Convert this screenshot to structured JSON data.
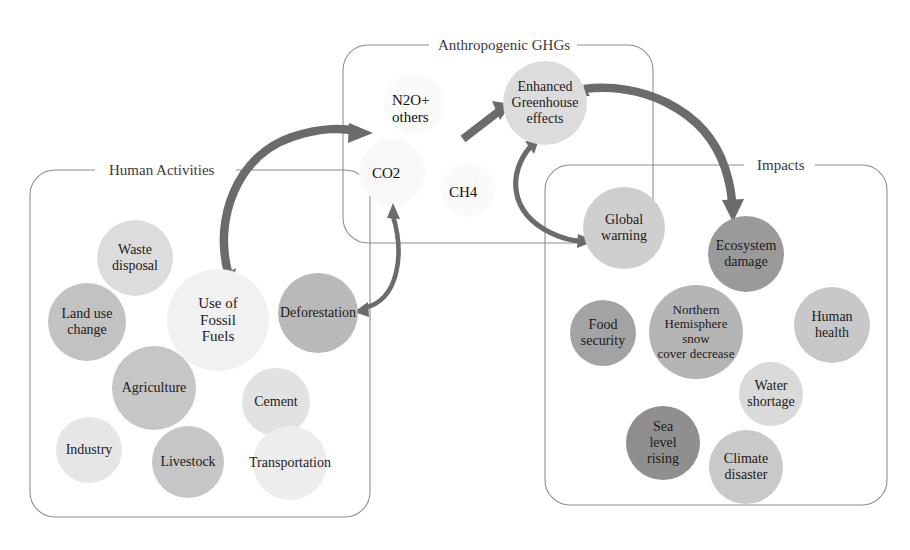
{
  "diagram": {
    "title_hidden": "",
    "groups": [
      {
        "id": "human-activities",
        "label": "Human Activities"
      },
      {
        "id": "anthropogenic-ghgs",
        "label": "Anthropogenic GHGs"
      },
      {
        "id": "impacts",
        "label": "Impacts"
      }
    ]
  },
  "human_activities": {
    "label": "Human Activities",
    "bubbles": [
      {
        "id": "waste-disposal",
        "label": "Waste\ndisposal",
        "color": "#dcdcdc",
        "cx": 135,
        "cy": 258,
        "r": 38,
        "fs": 14
      },
      {
        "id": "land-use-change",
        "label": "Land use\nchange",
        "color": "#c2c2c2",
        "cx": 87,
        "cy": 322,
        "r": 39,
        "fs": 14
      },
      {
        "id": "use-fossil-fuels",
        "label": "Use of\nFossil\nFuels",
        "color": "#f1f1f1",
        "cx": 218,
        "cy": 320,
        "r": 51,
        "fs": 15
      },
      {
        "id": "deforestation",
        "label": "Deforestation",
        "color": "#b9b9b9",
        "cx": 318,
        "cy": 313,
        "r": 40,
        "fs": 14
      },
      {
        "id": "agriculture",
        "label": "Agriculture",
        "color": "#c6c6c6",
        "cx": 154,
        "cy": 388,
        "r": 42,
        "fs": 14
      },
      {
        "id": "cement",
        "label": "Cement",
        "color": "#e2e2e2",
        "cx": 276,
        "cy": 402,
        "r": 34,
        "fs": 14
      },
      {
        "id": "industry",
        "label": "Industry",
        "color": "#e6e6e6",
        "cx": 89,
        "cy": 450,
        "r": 33,
        "fs": 14
      },
      {
        "id": "livestock",
        "label": "Livestock",
        "color": "#c6c6c6",
        "cx": 188,
        "cy": 462,
        "r": 36,
        "fs": 14
      },
      {
        "id": "transportation",
        "label": "Transportation",
        "color": "#ededed",
        "cx": 290,
        "cy": 463,
        "r": 37,
        "fs": 14
      }
    ]
  },
  "anthropogenic_ghgs": {
    "label": "Anthropogenic GHGs",
    "gas_labels": [
      {
        "id": "n2o-others",
        "label": "N2O+\nothers",
        "x": 392,
        "y": 92,
        "fs": 15,
        "halo": {
          "cx": 414,
          "cy": 104,
          "r": 30,
          "color": "#fafafa"
        }
      },
      {
        "id": "co2",
        "label": "CO2",
        "x": 372,
        "y": 165,
        "fs": 15,
        "halo": {
          "cx": 392,
          "cy": 172,
          "r": 33,
          "color": "#f8f8f8"
        }
      },
      {
        "id": "ch4",
        "label": "CH4",
        "x": 449,
        "y": 184,
        "fs": 15,
        "halo": {
          "cx": 468,
          "cy": 190,
          "r": 27,
          "color": "#fafafa"
        }
      }
    ],
    "bubbles": [
      {
        "id": "enhanced-greenhouse-effects",
        "label": "Enhanced\nGreenhouse\neffects",
        "color": "#dcdcdc",
        "cx": 545,
        "cy": 103,
        "r": 42,
        "fs": 14
      }
    ]
  },
  "impacts": {
    "label": "Impacts",
    "bubbles": [
      {
        "id": "global-warming",
        "label": "Global\nwarning",
        "color": "#cfcfcf",
        "cx": 624,
        "cy": 228,
        "r": 41,
        "fs": 14
      },
      {
        "id": "ecosystem-damage",
        "label": "Ecosystem\ndamage",
        "color": "#9a9a9a",
        "cx": 746,
        "cy": 254,
        "r": 38,
        "fs": 14
      },
      {
        "id": "food-security",
        "label": "Food\nsecurity",
        "color": "#a3a3a3",
        "cx": 603,
        "cy": 333,
        "r": 33,
        "fs": 14
      },
      {
        "id": "northern-snow-cover",
        "label": "Northern\nHemisphere snow\ncover decrease",
        "color": "#b5b5b5",
        "cx": 696,
        "cy": 332,
        "r": 47,
        "fs": 13
      },
      {
        "id": "human-health",
        "label": "Human\nhealth",
        "color": "#c8c8c8",
        "cx": 832,
        "cy": 325,
        "r": 38,
        "fs": 14
      },
      {
        "id": "water-shortage",
        "label": "Water\nshortage",
        "color": "#dadada",
        "cx": 771,
        "cy": 394,
        "r": 32,
        "fs": 14
      },
      {
        "id": "sea-level-rising",
        "label": "Sea\nlevel\nrising",
        "color": "#8f8f8f",
        "cx": 663,
        "cy": 443,
        "r": 37,
        "fs": 14
      },
      {
        "id": "climate-disaster",
        "label": "Climate\ndisaster",
        "color": "#c9c9c9",
        "cx": 746,
        "cy": 467,
        "r": 37,
        "fs": 14
      }
    ]
  },
  "arrows": [
    {
      "id": "fossil-fuels-to-ghgs",
      "from": "use-fossil-fuels",
      "to": "anthropogenic-ghgs"
    },
    {
      "id": "deforestation-co2-bidirectional",
      "from": "deforestation",
      "to": "co2"
    },
    {
      "id": "ghgs-to-enhanced-greenhouse",
      "from": "anthropogenic-ghgs",
      "to": "enhanced-greenhouse-effects"
    },
    {
      "id": "enhanced-greenhouse-to-global-warming",
      "from": "enhanced-greenhouse-effects",
      "to": "global-warming"
    },
    {
      "id": "enhanced-greenhouse-to-impacts",
      "from": "enhanced-greenhouse-effects",
      "to": "impacts"
    }
  ],
  "colors": {
    "arrow": "#6b6b6b",
    "box_border": "#8e8e8e",
    "text": "#1a1a1a",
    "background": "#ffffff"
  }
}
